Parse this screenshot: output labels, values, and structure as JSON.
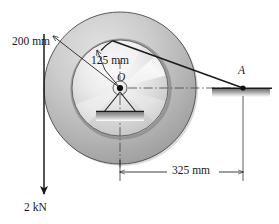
{
  "figure": {
    "background_color": "#ffffff",
    "line_color": "#1a1a1a",
    "width": 279,
    "height": 224
  },
  "labels": {
    "outer_radius": "200 mm",
    "inner_radius": "125 mm",
    "center_point": "O",
    "contact_point": "A",
    "horizontal_distance": "325 mm",
    "load_force": "2 kN"
  },
  "geometry": {
    "center": {
      "x": 120,
      "y": 88
    },
    "outer_pulley": {
      "radius_px": 76,
      "label": "200 mm",
      "fill": "#b9b9b9"
    },
    "inner_pulley": {
      "radius_px": 48,
      "label": "125 mm",
      "fill": "#dcdcdc"
    },
    "hub": {
      "radius_px": 7,
      "fill": "#e8e8e8"
    },
    "pin_center": {
      "radius_px": 3,
      "fill": "#101010"
    },
    "point_a": {
      "x": 243,
      "y": 88
    },
    "load_line_x": 44,
    "load_arrow_tip_y": 196,
    "dimension_325": {
      "from_x": 120,
      "to_x": 243,
      "y": 172
    }
  },
  "elements": {
    "cable_label": "cable",
    "support_block_label": "ground-support",
    "pin_support_label": "pin-support-O",
    "centerline_label": "centerline"
  },
  "colors": {
    "outer_ring_light": "#d6d6d6",
    "outer_ring_dark": "#9c9c9c",
    "inner_disc_light": "#f4f4f4",
    "inner_disc_mid": "#c8c8c8",
    "stroke": "#1a1a1a",
    "hatch": "#7a7a7a"
  }
}
